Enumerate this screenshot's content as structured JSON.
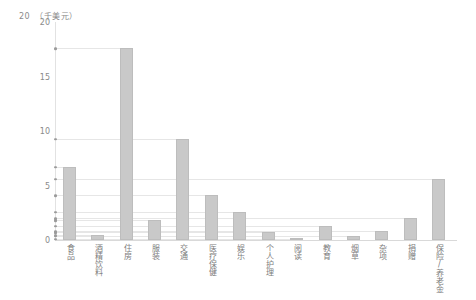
{
  "chart_data": {
    "type": "bar",
    "title": "",
    "unit_caption": "（千美元）",
    "unit_caption_number": "20",
    "xlabel": "",
    "ylabel": "",
    "ylim": [
      0,
      20
    ],
    "yticks": [
      0,
      5,
      10,
      15,
      20
    ],
    "ytick_labels": [
      "0",
      "5",
      "10",
      "15",
      "20"
    ],
    "grid": false,
    "leader_lines": true,
    "legend": null,
    "bar_color": "#c9c9c9",
    "categories": [
      "食品",
      "酒精饮料",
      "住房",
      "服装",
      "交通",
      "医疗保健",
      "娱乐",
      "个人护理",
      "阅读",
      "教育",
      "烟草",
      "杂项",
      "捐赠",
      "保险/养老金"
    ],
    "values": [
      6.7,
      0.5,
      17.6,
      1.8,
      9.3,
      4.1,
      2.6,
      0.7,
      0.1,
      1.3,
      0.4,
      0.8,
      2.0,
      5.6
    ]
  },
  "axis": {
    "y_top_label": "20",
    "unit_text": "（千美元）"
  }
}
